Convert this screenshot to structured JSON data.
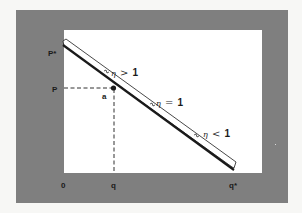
{
  "diagram": {
    "title": "",
    "type": "linear demand curve with elasticity regions",
    "colors": {
      "page_background": "#f7f7f5",
      "frame": "#7f7f7f",
      "plot_area": "#ffffff",
      "ink": "#1a1a1a"
    },
    "axes": {
      "y_labels": {
        "p_star": "P*",
        "p": "P"
      },
      "x_labels": {
        "origin": "0",
        "q": "q",
        "q_star": "q*"
      }
    },
    "curve": {
      "description": "straight downward-sloping demand line from P* to q*",
      "start": "P*",
      "end": "q*"
    },
    "point": {
      "label": "a",
      "x_ref": "q",
      "y_ref": "P"
    },
    "regions": [
      {
        "label_symbol": "η",
        "label_rel": ">",
        "label_value": "1",
        "text": "η > 1"
      },
      {
        "label_symbol": "η",
        "label_rel": "=",
        "label_value": "1",
        "text": "η = 1"
      },
      {
        "label_symbol": "η",
        "label_rel": "<",
        "label_value": "1",
        "text": "η < 1"
      }
    ]
  }
}
